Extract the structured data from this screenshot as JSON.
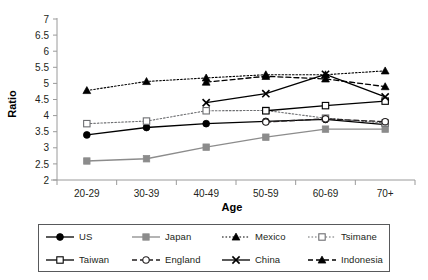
{
  "chart_data": {
    "type": "line",
    "title": "",
    "xlabel": "Age",
    "ylabel": "Ratio",
    "categories": [
      "20-29",
      "30-39",
      "40-49",
      "50-59",
      "60-69",
      "70+"
    ],
    "ylim": [
      2,
      7
    ],
    "ytick_step": 0.5,
    "yticks": [
      "2",
      "2.5",
      "3",
      "3.5",
      "4",
      "4.5",
      "5",
      "5.5",
      "6",
      "6.5",
      "7"
    ],
    "grid": false,
    "legend_position": "bottom",
    "series": [
      {
        "name": "US",
        "values": [
          3.4,
          3.63,
          3.75,
          3.82,
          3.88,
          3.72
        ],
        "color": "#000000",
        "line_style": "solid",
        "marker": "filled-circle"
      },
      {
        "name": "Japan",
        "values": [
          2.59,
          2.66,
          3.02,
          3.33,
          3.58,
          3.58
        ],
        "color": "#8c8c8c",
        "line_style": "solid",
        "marker": "filled-square"
      },
      {
        "name": "Mexico",
        "values": [
          4.78,
          5.06,
          5.17,
          5.27,
          5.27,
          5.39
        ],
        "color": "#000000",
        "line_style": "dotted",
        "marker": "filled-triangle"
      },
      {
        "name": "Tsimane",
        "values": [
          3.75,
          3.83,
          4.15,
          4.16,
          3.92,
          3.77
        ],
        "color": "#6d6e71",
        "line_style": "dotted",
        "marker": "open-square"
      },
      {
        "name": "Taiwan",
        "values": [
          null,
          null,
          null,
          4.15,
          4.31,
          4.45
        ],
        "color": "#000000",
        "line_style": "solid",
        "marker": "open-square"
      },
      {
        "name": "England",
        "values": [
          null,
          null,
          null,
          3.8,
          3.9,
          3.81
        ],
        "color": "#231f20",
        "line_style": "dashed",
        "marker": "open-circle"
      },
      {
        "name": "China",
        "values": [
          null,
          null,
          4.4,
          4.68,
          5.28,
          4.58
        ],
        "color": "#000000",
        "line_style": "solid",
        "marker": "cross-x"
      },
      {
        "name": "Indonesia",
        "values": [
          null,
          null,
          5.04,
          5.22,
          5.14,
          4.9
        ],
        "color": "#000000",
        "line_style": "dashed",
        "marker": "filled-triangle"
      }
    ]
  },
  "legend": {
    "rows": [
      [
        "US",
        "Japan",
        "Mexico",
        "Tsimane"
      ],
      [
        "Taiwan",
        "England",
        "China",
        "Indonesia"
      ]
    ]
  },
  "axes": {
    "x_title": "Age",
    "y_title": "Ratio"
  }
}
